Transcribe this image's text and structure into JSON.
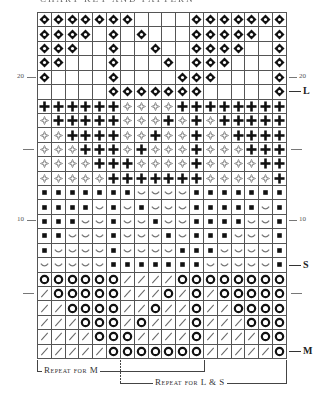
{
  "title": "CHART KEY AND PATTERN",
  "legend_symbols": {
    "D": "diamond-ring",
    "E": "empty",
    "P": "bold-plus",
    "d": "open-diamond",
    "S": "filled-square",
    "U": "smile-curve",
    "O": "ring",
    "/": "slash"
  },
  "chart_data": {
    "type": "table",
    "columns": 18,
    "rows_count": 24,
    "row_order": "top-to-bottom = row 24 down to row 1",
    "rows": [
      "DDDDDDDEEEEDDDDDDD",
      "DDDDEDEDEEEDDDDDED",
      "DDDEEDEEDEEDDDDEED",
      "DDEEEDEEEDEDDDEEED",
      "DEEEEDEEEEDDDEEEED",
      "EEEEEDDDDDDDEEEEED",
      "PPPPPPddddPPPPPPPP",
      "dPPPPPdddPdPdPPPPP",
      "ddPPPPddPddPddPPPP",
      "dddPPPdPdddPdddPPP",
      "ddddPPPddddPddddPP",
      "dddddPPPPPPPdddddP",
      "SSSSSSSUUUUSSSSSSS",
      "SSSSUSUSUUUSSSSSUS",
      "SSSUUSUUSUUSSSSUUS",
      "SSUUUSUUUSUSSSUUUS",
      "SUUUUSUUUUSSSUUUUS",
      "UUUUUSSSSSSSUUUUUS",
      "OOOOOO////OOOOOOOO",
      "/OOOOO///O/O/OOOOO",
      "//OOOO//O//O//OOOO",
      "///OOO/O///O///OOO",
      "////OOO////O////OO",
      "/////OOOOOOO/////O"
    ],
    "left_markers": [
      {
        "label": "20",
        "row": 20
      },
      {
        "label": "",
        "row": 15
      },
      {
        "label": "10",
        "row": 10
      },
      {
        "label": "",
        "row": 5
      }
    ],
    "right_markers": [
      {
        "label": "20",
        "row": 20
      },
      {
        "label": "L",
        "row": 19,
        "bold": true
      },
      {
        "label": "",
        "row": 15
      },
      {
        "label": "10",
        "row": 10
      },
      {
        "label": "S",
        "row": 7,
        "bold": true
      },
      {
        "label": "",
        "row": 5
      },
      {
        "label": "M",
        "row": 1,
        "bold": true
      }
    ],
    "repeats": [
      {
        "label": "Repeat for M",
        "start_col": 1,
        "end_col": 12
      },
      {
        "label": "Repeat for L & S",
        "start_col": 7,
        "end_col": 18
      }
    ]
  },
  "markers": {
    "left_20": "20",
    "left_10": "10",
    "right_20": "20",
    "right_10": "10",
    "size_L": "L",
    "size_S": "S",
    "size_M": "M"
  },
  "repeats": {
    "m_label": "Repeat for M",
    "ls_label": "Repeat for L & S"
  }
}
